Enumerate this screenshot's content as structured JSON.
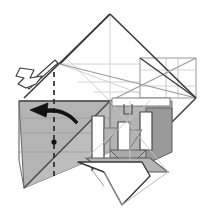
{
  "figure": {
    "kind": "origami-folding-step-diagram",
    "title": "",
    "canvas": {
      "width": 208,
      "height": 212,
      "background": "#ffffff"
    },
    "palette": {
      "paper_front": "#ffffff",
      "paper_back_shade": "#b4b4b4",
      "paper_back_shade_dark": "#9a9a9a",
      "paper_back_shade_light": "#c9c9c9",
      "edge_stroke": "#3a3a3a",
      "crease_stroke": "#bdbdbd",
      "crease_stroke_soft": "#d2d2d2",
      "dashed_axis_stroke": "#2b2b2b",
      "arrow_solid_fill": "#121212",
      "arrow_hollow_fill": "#ffffff",
      "arrow_hollow_stroke": "#3a3a3a",
      "pivot_dot_fill": "#121212"
    },
    "symbols": {
      "rotation_arrow": {
        "name": "curved-rotation-arrow",
        "style": "solid-filled",
        "direction": "leftward-curving",
        "meaning": "rotate-flap"
      },
      "push_arrow": {
        "name": "hollow-push-arrow",
        "style": "outlined-open",
        "direction": "up-left",
        "meaning": "push-in-reverse-fold"
      },
      "axis": {
        "name": "dashed-fold-axis",
        "style": "dashed-vertical",
        "meaning": "fold-or-rotation-axis"
      },
      "pivot": {
        "name": "pivot-point-dot",
        "style": "filled-circle",
        "meaning": "rotation-pivot"
      }
    },
    "geometry": {
      "apex": [
        110,
        14
      ],
      "right_corner": [
        196,
        98
      ],
      "left_shoulder": [
        60,
        64
      ],
      "base_center": [
        110,
        101
      ],
      "gray_panel_left": [
        19,
        101
      ],
      "gray_panel_tip": [
        24,
        188
      ],
      "axis_x": 54,
      "axis_top_y": 72,
      "axis_bottom_y": 177,
      "pivot_point": [
        54,
        142
      ]
    },
    "shapes": [
      {
        "name": "upper-kite-front-face",
        "fill": "paper_front",
        "points": "110,14 196,98 24,98 60,64"
      },
      {
        "name": "left-back-panel",
        "fill": "paper_back_shade",
        "points": "19,101 110,101 110,150 24,188"
      },
      {
        "name": "bottom-v-flap",
        "fill": "paper_front",
        "points": "78,160 122,205 150,175 142,160"
      }
    ]
  }
}
